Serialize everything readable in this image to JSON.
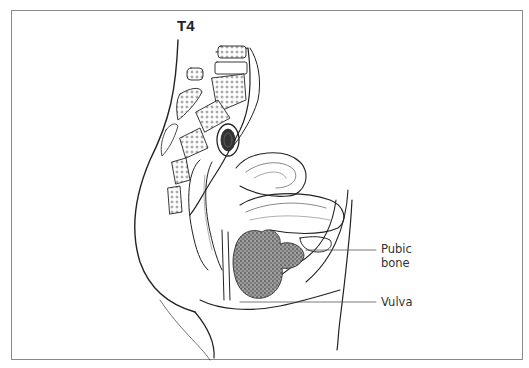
{
  "figure": {
    "stage_label": "T4",
    "labels": [
      {
        "id": "pubic-bone",
        "text_line1": "Pubic",
        "text_line2": "bone"
      },
      {
        "id": "vulva",
        "text_line1": "Vulva"
      }
    ],
    "colors": {
      "border": "#8a8a8a",
      "ink": "#222222",
      "tumor": "#555555"
    }
  }
}
